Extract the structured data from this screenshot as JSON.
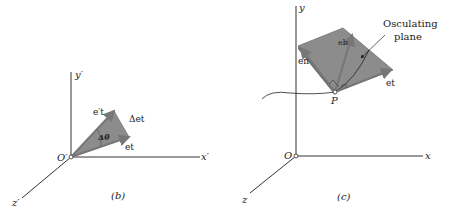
{
  "panel_b": {
    "caption": "(b)",
    "axes": {
      "x": "x′",
      "y": "y′",
      "z": "z′",
      "origin": "O′"
    },
    "vectors": {
      "et_prime": "e′t",
      "et": "et",
      "delta_et": "Δet"
    },
    "angle": "Δθ"
  },
  "panel_c": {
    "caption": "(c)",
    "axes": {
      "x": "x",
      "y": "y",
      "z": "z",
      "origin": "O"
    },
    "point": "P",
    "vectors": {
      "en": "en",
      "et": "et",
      "eb": "eb"
    },
    "annotation": {
      "line1": "Osculating",
      "line2": "plane"
    }
  },
  "colors": {
    "plane": "#8c8c8c",
    "plane_edge": "#6f6f6f",
    "vector": "#7a7a7a",
    "axis": "#333333"
  }
}
